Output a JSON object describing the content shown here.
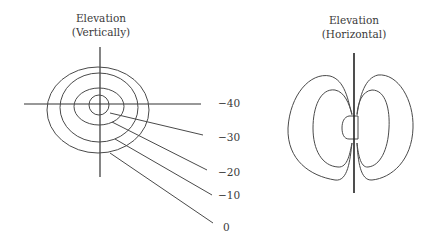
{
  "left_diagram": {
    "title_line1": "Elevation",
    "title_line2": "(Vertically)",
    "contour_labels": [
      "−40",
      "−30",
      "−20",
      "−10",
      "0"
    ]
  },
  "right_diagram": {
    "title_line1": "Elevation",
    "title_line2": "(Horizontal)"
  }
}
